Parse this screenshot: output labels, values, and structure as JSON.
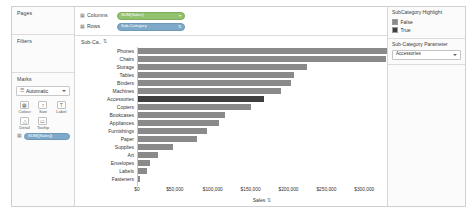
{
  "shelves": {
    "pages_label": "Pages",
    "filters_label": "Filters",
    "marks_label": "Marks",
    "columns_label": "Columns",
    "rows_label": "Rows",
    "columns_pill": "SUM(Sales)",
    "rows_pill": "Sub-Category",
    "columns_icon": "grid-icon",
    "rows_icon": "grid-icon",
    "caret": "▾"
  },
  "marks": {
    "type_value": "Automatic",
    "type_icon": "automatic-mark-icon",
    "buttons": [
      {
        "label": "Colour",
        "icon": "color-icon",
        "glyph": "▣"
      },
      {
        "label": "Size",
        "icon": "size-icon",
        "glyph": "↕"
      },
      {
        "label": "Label",
        "icon": "label-icon",
        "glyph": "T"
      },
      {
        "label": "Detail",
        "icon": "detail-icon",
        "glyph": "△"
      },
      {
        "label": "Tooltip",
        "icon": "tooltip-icon",
        "glyph": "▭"
      }
    ],
    "card_pill": "SUM([Sales])",
    "card_pill_icon": "grid-icon"
  },
  "viz": {
    "row_field_header": "Sub-Ca..",
    "row_sort_icon": "sort-descending-icon",
    "axis_title": "Sales",
    "axis_sort_icon": "sort-descending-icon",
    "highlight_category": "Accessories"
  },
  "legend": {
    "title": "SubCategory Highlight",
    "items": [
      {
        "label": "False",
        "color": "#8a8a8a"
      },
      {
        "label": "True",
        "color": "#3f3f3f"
      }
    ]
  },
  "parameter": {
    "title": "Sub-Category Parameter",
    "value": "Accessories",
    "caret_icon": "chevron-down-icon"
  },
  "chart_data": {
    "type": "bar",
    "title": "",
    "orientation": "horizontal",
    "xlabel": "Sales",
    "ylabel": "Sub-Category",
    "xlim": [
      0,
      330000
    ],
    "grid": false,
    "legend_position": "right",
    "tick_labels": [
      "$0",
      "$50,000",
      "$100,000",
      "$150,000",
      "$200,000",
      "$250,000",
      "$300,000"
    ],
    "tick_values": [
      0,
      50000,
      100000,
      150000,
      200000,
      250000,
      300000
    ],
    "highlighted": "Accessories",
    "categories": [
      "Phones",
      "Chairs",
      "Storage",
      "Tables",
      "Binders",
      "Machines",
      "Accessories",
      "Copiers",
      "Bookcases",
      "Appliances",
      "Furnishings",
      "Paper",
      "Supplies",
      "Art",
      "Envelopes",
      "Labels",
      "Fasteners"
    ],
    "values": [
      330007,
      328449,
      223844,
      206966,
      203413,
      189239,
      167380,
      149528,
      114880,
      107532,
      91705,
      78479,
      46674,
      27119,
      16476,
      12486,
      3024
    ],
    "series": [
      {
        "name": "SUM(Sales)",
        "values": [
          330007,
          328449,
          223844,
          206966,
          203413,
          189239,
          167380,
          149528,
          114880,
          107532,
          91705,
          78479,
          46674,
          27119,
          16476,
          12486,
          3024
        ]
      }
    ],
    "highlight_flags": [
      false,
      false,
      false,
      false,
      false,
      false,
      true,
      false,
      false,
      false,
      false,
      false,
      false,
      false,
      false,
      false,
      false
    ]
  }
}
